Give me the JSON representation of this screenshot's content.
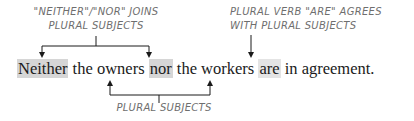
{
  "annotations": {
    "top_left": {
      "line1": "\"NEITHER\"/\"NOR\" JOINS",
      "line2": "PLURAL SUBJECTS"
    },
    "top_right": {
      "line1": "PLURAL VERB \"ARE\" AGREES",
      "line2": "WITH PLURAL SUBJECTS"
    },
    "bottom": {
      "line1": "PLURAL SUBJECTS"
    }
  },
  "sentence": {
    "w1": "Neither",
    "s1": " the ",
    "w2": "owners",
    "s2": " ",
    "w3": "nor",
    "s3": " the ",
    "w4": "workers",
    "s4": " ",
    "w5": "are",
    "s5": " in agreement."
  },
  "colors": {
    "highlight_conjunction": "#d6d6d6",
    "highlight_verb": "#e4e4e4",
    "label_text": "#6e6e6e",
    "line": "#1a1a1a"
  }
}
